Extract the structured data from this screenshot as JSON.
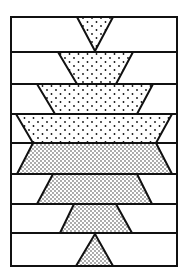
{
  "diagram": {
    "type": "quilt-block",
    "colors": {
      "background": "#ffffff",
      "stroke": "#111111",
      "dots": "#111111"
    },
    "frame": {
      "x1": 11,
      "y1": 17,
      "x2": 177,
      "y2": 266
    },
    "row_lines": [
      17,
      52,
      84,
      114,
      143,
      174,
      204,
      233,
      266
    ],
    "shapes": [
      {
        "name": "top-triangle",
        "points": [
          [
            77,
            17
          ],
          [
            113,
            17
          ],
          [
            95,
            51
          ]
        ],
        "dot_density": "sparse"
      },
      {
        "name": "row-2-trapezoid",
        "points": [
          [
            58,
            52
          ],
          [
            133,
            52
          ],
          [
            116,
            84
          ],
          [
            77,
            84
          ]
        ],
        "dot_density": "sparse"
      },
      {
        "name": "row-3-trapezoid",
        "points": [
          [
            37,
            84
          ],
          [
            153,
            84
          ],
          [
            137,
            114
          ],
          [
            55,
            114
          ]
        ],
        "dot_density": "sparse"
      },
      {
        "name": "row-4-trapezoid",
        "points": [
          [
            16,
            114
          ],
          [
            172,
            114
          ],
          [
            156,
            143
          ],
          [
            33,
            143
          ]
        ],
        "dot_density": "sparse"
      },
      {
        "name": "row-5-trapezoid",
        "points": [
          [
            33,
            143
          ],
          [
            156,
            143
          ],
          [
            172,
            174
          ],
          [
            17,
            174
          ]
        ],
        "dot_density": "dense"
      },
      {
        "name": "row-6-trapezoid",
        "points": [
          [
            53,
            174
          ],
          [
            137,
            174
          ],
          [
            152,
            204
          ],
          [
            37,
            204
          ]
        ],
        "dot_density": "dense"
      },
      {
        "name": "row-7-trapezoid",
        "points": [
          [
            74,
            204
          ],
          [
            116,
            204
          ],
          [
            132,
            233
          ],
          [
            60,
            233
          ]
        ],
        "dot_density": "dense"
      },
      {
        "name": "bottom-triangle",
        "points": [
          [
            95,
            234
          ],
          [
            113,
            266
          ],
          [
            76,
            266
          ]
        ],
        "dot_density": "dense"
      }
    ]
  }
}
